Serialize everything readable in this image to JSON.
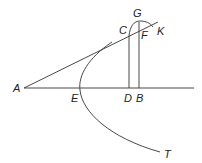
{
  "diagram": {
    "type": "geometric-figure",
    "labels": {
      "A": "A",
      "C": "C",
      "G": "G",
      "F": "F",
      "K": "K",
      "E": "E",
      "D": "D",
      "B": "B",
      "T": "T"
    },
    "colors": {
      "line": "#333333",
      "text": "#222222",
      "background": "#ffffff"
    }
  }
}
